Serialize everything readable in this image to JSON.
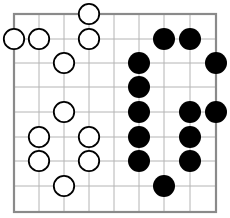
{
  "board": {
    "type": "go-board-fragment",
    "columns": 9,
    "rows": 9,
    "grid_x": [
      14,
      39,
      64,
      89,
      114,
      139,
      164,
      190,
      216
    ],
    "grid_y": [
      14,
      39,
      63,
      87,
      112,
      137,
      161,
      186,
      212
    ],
    "stone_radius": 11,
    "colors": {
      "border": "#8a8a8a",
      "grid": "#b4b4b4",
      "black_stone": "#000000",
      "white_stone_fill": "#ffffff",
      "white_stone_outline": "#000000",
      "background": "#ffffff"
    },
    "stones": [
      {
        "color": "white",
        "col": 3,
        "row": 0
      },
      {
        "color": "white",
        "col": 0,
        "row": 1
      },
      {
        "color": "white",
        "col": 1,
        "row": 1
      },
      {
        "color": "white",
        "col": 3,
        "row": 1
      },
      {
        "color": "white",
        "col": 2,
        "row": 2
      },
      {
        "color": "white",
        "col": 2,
        "row": 4
      },
      {
        "color": "white",
        "col": 1,
        "row": 5
      },
      {
        "color": "white",
        "col": 3,
        "row": 5
      },
      {
        "color": "white",
        "col": 1,
        "row": 6
      },
      {
        "color": "white",
        "col": 3,
        "row": 6
      },
      {
        "color": "white",
        "col": 2,
        "row": 7
      },
      {
        "color": "black",
        "col": 6,
        "row": 1
      },
      {
        "color": "black",
        "col": 7,
        "row": 1
      },
      {
        "color": "black",
        "col": 5,
        "row": 2
      },
      {
        "color": "black",
        "col": 8,
        "row": 2
      },
      {
        "color": "black",
        "col": 5,
        "row": 3
      },
      {
        "color": "black",
        "col": 5,
        "row": 4
      },
      {
        "color": "black",
        "col": 7,
        "row": 4
      },
      {
        "color": "black",
        "col": 8,
        "row": 4
      },
      {
        "color": "black",
        "col": 5,
        "row": 5
      },
      {
        "color": "black",
        "col": 7,
        "row": 5
      },
      {
        "color": "black",
        "col": 5,
        "row": 6
      },
      {
        "color": "black",
        "col": 7,
        "row": 6
      },
      {
        "color": "black",
        "col": 6,
        "row": 7
      }
    ]
  }
}
